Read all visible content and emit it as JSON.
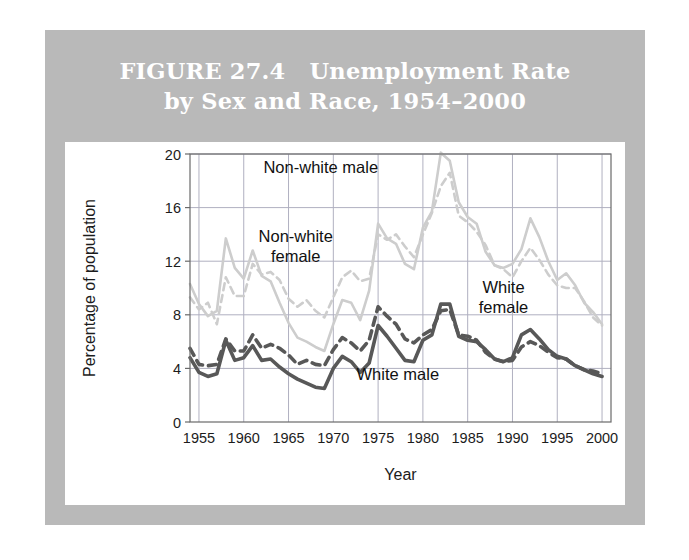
{
  "figure": {
    "title_line1": "FIGURE 27.4   Unemployment Rate",
    "title_line2": "by Sex and Race, 1954–2000",
    "band_color": "#b9b9b9",
    "card_color": "#ffffff"
  },
  "chart_data": {
    "type": "line",
    "title": "FIGURE 27.4   Unemployment Rate by Sex and Race, 1954–2000",
    "xlabel": "Year",
    "ylabel": "Percentage of population",
    "xlim": [
      1954,
      2001
    ],
    "ylim": [
      0,
      20
    ],
    "yticks": [
      0,
      4,
      8,
      12,
      16,
      20
    ],
    "xticks": [
      1955,
      1960,
      1965,
      1970,
      1975,
      1980,
      1985,
      1990,
      1995,
      2000
    ],
    "grid": true,
    "legend": "inline-annotations",
    "x": [
      1954,
      1955,
      1956,
      1957,
      1958,
      1959,
      1960,
      1961,
      1962,
      1963,
      1964,
      1965,
      1966,
      1967,
      1968,
      1969,
      1970,
      1971,
      1972,
      1973,
      1974,
      1975,
      1976,
      1977,
      1978,
      1979,
      1980,
      1981,
      1982,
      1983,
      1984,
      1985,
      1986,
      1987,
      1988,
      1989,
      1990,
      1991,
      1992,
      1993,
      1994,
      1995,
      1996,
      1997,
      1998,
      1999,
      2000
    ],
    "series": [
      {
        "name": "Non-white male",
        "color": "#cdcdcd",
        "style": "solid",
        "label": "Non-white male",
        "label_x": 1968.6,
        "label_y": 18.6,
        "values": [
          10.3,
          8.8,
          7.9,
          8.3,
          13.7,
          11.5,
          10.7,
          12.8,
          10.9,
          10.5,
          8.9,
          7.4,
          6.3,
          6.0,
          5.6,
          5.3,
          7.3,
          9.1,
          8.9,
          7.6,
          9.8,
          14.8,
          13.7,
          13.3,
          11.8,
          11.4,
          14.5,
          15.7,
          20.1,
          19.5,
          16.4,
          15.3,
          14.8,
          12.7,
          11.7,
          11.5,
          11.8,
          12.9,
          15.2,
          13.8,
          12.0,
          10.6,
          11.1,
          10.2,
          8.9,
          8.2,
          7.3
        ]
      },
      {
        "name": "Non-white female",
        "color": "#cdcdcd",
        "style": "dashed",
        "label": "Non-white female",
        "label_x": 1965.8,
        "label_y": 13.4,
        "values": [
          9.3,
          8.4,
          8.9,
          7.3,
          10.8,
          9.4,
          9.4,
          11.8,
          11.0,
          11.2,
          10.6,
          9.2,
          8.6,
          9.1,
          8.3,
          7.8,
          9.3,
          10.8,
          11.3,
          10.5,
          10.7,
          14.0,
          13.6,
          14.0,
          13.1,
          12.3,
          14.0,
          15.6,
          17.6,
          18.6,
          15.4,
          14.9,
          14.2,
          13.2,
          11.7,
          11.4,
          10.8,
          12.0,
          13.0,
          12.1,
          11.0,
          10.2,
          10.0,
          10.0,
          9.0,
          7.8,
          7.2
        ]
      },
      {
        "name": "White female",
        "color": "#585858",
        "style": "dashed",
        "label": "White female",
        "label_x": 1989.0,
        "label_y": 9.6,
        "values": [
          5.5,
          4.3,
          4.2,
          4.3,
          6.2,
          5.3,
          5.3,
          6.5,
          5.5,
          5.8,
          5.5,
          5.0,
          4.3,
          4.6,
          4.3,
          4.2,
          5.4,
          6.3,
          5.9,
          5.3,
          6.1,
          8.6,
          7.9,
          7.3,
          6.2,
          5.9,
          6.5,
          6.9,
          8.3,
          8.4,
          6.5,
          6.4,
          6.1,
          5.2,
          4.7,
          4.5,
          4.6,
          5.6,
          6.0,
          5.7,
          5.2,
          4.8,
          4.7,
          4.2,
          3.9,
          3.8,
          3.6
        ]
      },
      {
        "name": "White male",
        "color": "#585858",
        "style": "solid",
        "label": "White male",
        "label_x": 1977.2,
        "label_y": 3.1,
        "values": [
          4.8,
          3.7,
          3.4,
          3.6,
          6.1,
          4.6,
          4.8,
          5.7,
          4.6,
          4.7,
          4.1,
          3.6,
          3.2,
          2.9,
          2.6,
          2.5,
          4.0,
          4.9,
          4.5,
          3.7,
          4.4,
          7.2,
          6.4,
          5.5,
          4.6,
          4.5,
          6.1,
          6.5,
          8.8,
          8.8,
          6.4,
          6.1,
          6.0,
          5.4,
          4.7,
          4.5,
          4.8,
          6.5,
          6.9,
          6.2,
          5.4,
          4.9,
          4.7,
          4.2,
          3.9,
          3.6,
          3.4
        ]
      }
    ]
  },
  "labels": {
    "y_axis_title": "Percentage of population",
    "x_axis_title": "Year"
  }
}
